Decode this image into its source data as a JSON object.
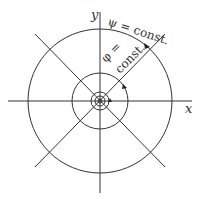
{
  "diagram": {
    "axes": {
      "x_label": "x",
      "y_label": "y"
    },
    "labels": {
      "psi": "ψ = const.",
      "phi_top": "φ =",
      "phi_bottom": "const."
    },
    "circles_radii": [
      72,
      28,
      9,
      5,
      2
    ],
    "center": [
      100,
      101
    ],
    "stroke_color": "#333333"
  }
}
